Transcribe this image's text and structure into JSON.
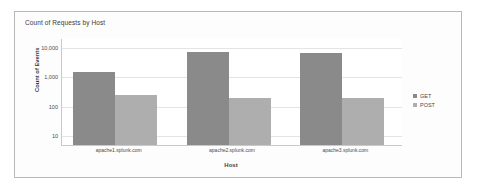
{
  "panel": {
    "title": "Count of Requests by Host"
  },
  "legend": {
    "position": "right",
    "entries": [
      {
        "label": "GET",
        "color": "#8a8a8a"
      },
      {
        "label": "POST",
        "color": "#aeaeae"
      }
    ]
  },
  "chart_data": {
    "type": "bar",
    "title": "Count of Requests by Host",
    "xlabel": "Host",
    "ylabel": "Count of Events",
    "yscale": "log",
    "ylim": [
      5,
      20000
    ],
    "grid": true,
    "yticks": [
      "10",
      "100",
      "1,000",
      "10,000"
    ],
    "ytick_values": [
      10,
      100,
      1000,
      10000
    ],
    "categories": [
      "apache1.splunk.com",
      "apache2.splunk.com",
      "apache3.splunk.com"
    ],
    "series": [
      {
        "name": "GET",
        "color": "#8a8a8a",
        "values": [
          1500,
          7000,
          6500
        ]
      },
      {
        "name": "POST",
        "color": "#aeaeae",
        "values": [
          250,
          200,
          200
        ]
      }
    ]
  }
}
